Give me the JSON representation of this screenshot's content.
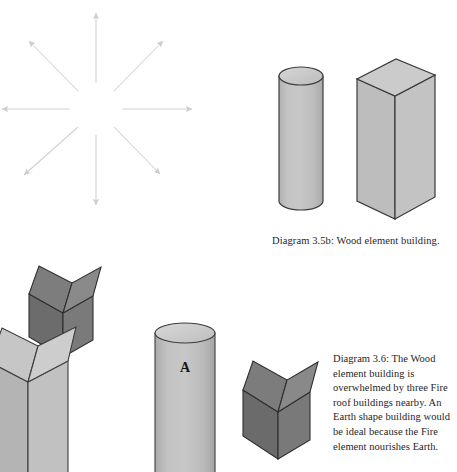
{
  "page": {
    "background_color": "#ffffff",
    "width": 457,
    "height": 472
  },
  "captions": {
    "diagram_35b": "Diagram 3.5b: Wood element building.",
    "diagram_36": "Diagram 3.6: The Wood element building is overwhelmed by three Fire roof buildings nearby. An Earth shape building would be ideal because the Fire element nourishes Earth."
  },
  "labels": {
    "building_a": "A"
  },
  "top_cutoff_text": "",
  "colors": {
    "arrow": "#d2d2d2",
    "light_face": "#b9b9b9",
    "light_face_alt": "#c4c4c4",
    "light_top": "#cfcfcf",
    "dark_face": "#6f6f6f",
    "dark_face_alt": "#7b7b7b",
    "dark_top": "#848484",
    "outline": "#3a3a3a",
    "outline_light": "#555555",
    "text": "#262626"
  },
  "figures": {
    "starburst": {
      "name": "eight-direction-arrow-burst",
      "arrow_count": 8,
      "center_x": 96,
      "center_y": 105,
      "inner_radius": 26,
      "outer_radius": 95,
      "directions": [
        "N",
        "NE",
        "E",
        "SE",
        "S",
        "SW",
        "W",
        "NW"
      ]
    },
    "wood_cylinder": {
      "name": "wood-element-cylinder-building",
      "shape": "cylinder"
    },
    "wood_box": {
      "name": "wood-element-rectangular-building",
      "shape": "rectangular-prism"
    },
    "scene_objects": [
      {
        "name": "fire-roof-building-light-tall",
        "shape": "peaked-roof-tower",
        "tone": "light"
      },
      {
        "name": "fire-roof-building-dark-upper",
        "shape": "peaked-roof-house",
        "tone": "dark"
      },
      {
        "name": "wood-cylinder-building-a",
        "shape": "cylinder",
        "tone": "light",
        "label": "A"
      },
      {
        "name": "fire-roof-building-dark-right",
        "shape": "peaked-roof-house",
        "tone": "dark"
      }
    ]
  }
}
